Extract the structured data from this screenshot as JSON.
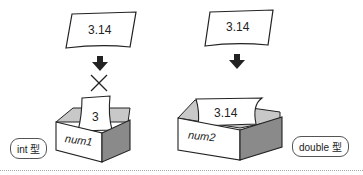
{
  "left": {
    "card_value": "3.14",
    "blocked_marker": "×",
    "inner_card_value": "3",
    "box_label": "num1",
    "type_badge": "int 型"
  },
  "right": {
    "card_value": "3.14",
    "inner_card_value": "3.14",
    "box_label": "num2",
    "type_badge": "double 型"
  }
}
